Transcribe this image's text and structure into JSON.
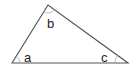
{
  "diagram": {
    "type": "triangle",
    "vertices": {
      "left": [
        12,
        63
      ],
      "top": [
        48,
        5
      ],
      "right": [
        128,
        63
      ]
    },
    "angle_labels": {
      "a": "a",
      "b": "b",
      "c": "c"
    },
    "colors": {
      "stroke": "#555555",
      "text": "#222222",
      "arc": "#aaaaaa",
      "background": "#ffffff"
    }
  }
}
